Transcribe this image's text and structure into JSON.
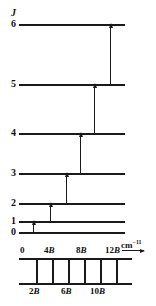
{
  "figure": {
    "axis_label": "J",
    "unit": "cm",
    "unit_exponent": "−1",
    "ink_color": "#1a1a1a"
  },
  "chart_data": {
    "type": "diagram",
    "xlabel": "",
    "ylabel": "J",
    "levels": [
      {
        "label": "6",
        "J": 6,
        "energy_B": 42,
        "y": 24
      },
      {
        "label": "5",
        "J": 5,
        "energy_B": 30,
        "y": 84
      },
      {
        "label": "4",
        "J": 4,
        "energy_B": 20,
        "y": 133
      },
      {
        "label": "3",
        "J": 3,
        "energy_B": 12,
        "y": 173
      },
      {
        "label": "2",
        "J": 2,
        "energy_B": 6,
        "y": 203
      },
      {
        "label": "1",
        "J": 1,
        "energy_B": 2,
        "y": 221
      },
      {
        "label": "0",
        "J": 0,
        "energy_B": 0,
        "y": 232
      }
    ],
    "level_line_x_start": 19,
    "level_line_x_end": 125,
    "transitions": [
      {
        "from": 0,
        "to": 1,
        "x": 33,
        "spacing_B": 2
      },
      {
        "from": 1,
        "to": 2,
        "x": 50,
        "spacing_B": 4
      },
      {
        "from": 2,
        "to": 3,
        "x": 66,
        "spacing_B": 6
      },
      {
        "from": 3,
        "to": 4,
        "x": 80,
        "spacing_B": 8
      },
      {
        "from": 4,
        "to": 5,
        "x": 94,
        "spacing_B": 10
      },
      {
        "from": 5,
        "to": 6,
        "x": 110,
        "spacing_B": 12
      }
    ],
    "spectrum": {
      "baseline_top_y": 258,
      "baseline_bottom_y": 283,
      "baseline_x_start": 19,
      "baseline_x_end": 132,
      "lines_x": [
        36,
        52,
        68,
        84,
        100,
        116
      ],
      "line_values_B": [
        2,
        4,
        6,
        8,
        10,
        12
      ],
      "top_ticks": [
        {
          "value": "0",
          "suffix": "",
          "x": 20
        },
        {
          "value": "4",
          "suffix": "B",
          "x": 44
        },
        {
          "value": "8",
          "suffix": "B",
          "x": 76
        },
        {
          "value": "12",
          "suffix": "B",
          "x": 105
        }
      ],
      "bottom_ticks": [
        {
          "value": "2",
          "suffix": "B",
          "x": 29
        },
        {
          "value": "6",
          "suffix": "B",
          "x": 61
        },
        {
          "value": "10",
          "suffix": "B",
          "x": 90
        }
      ]
    }
  }
}
